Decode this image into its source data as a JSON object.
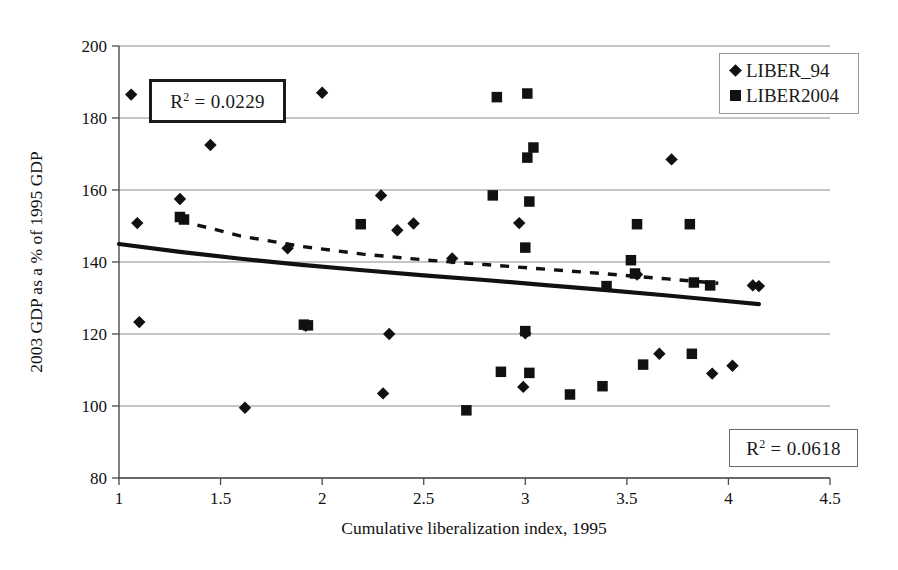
{
  "chart_data": {
    "type": "scatter",
    "title": "",
    "xlabel": "Cumulative liberalization index, 1995",
    "ylabel": "2003 GDP as a % of 1995 GDP",
    "xlim": [
      1,
      4.5
    ],
    "ylim": [
      80,
      200
    ],
    "xticks": [
      "1",
      "1.5",
      "2",
      "2.5",
      "3",
      "3.5",
      "4",
      "4.5"
    ],
    "xtick_values": [
      1,
      1.5,
      2,
      2.5,
      3,
      3.5,
      4,
      4.5
    ],
    "yticks": [
      "80",
      "100",
      "120",
      "140",
      "160",
      "180",
      "200"
    ],
    "ytick_values": [
      80,
      100,
      120,
      140,
      160,
      180,
      200
    ],
    "grid": true,
    "legend_position": "top-right",
    "series": [
      {
        "name": "LIBER_94",
        "marker": "diamond",
        "color": "#111111",
        "points": [
          [
            1.06,
            186.5
          ],
          [
            1.09,
            150.8
          ],
          [
            1.1,
            123.3
          ],
          [
            1.3,
            157.5
          ],
          [
            1.31,
            152.2
          ],
          [
            1.45,
            172.5
          ],
          [
            1.62,
            99.5
          ],
          [
            1.83,
            143.8
          ],
          [
            1.92,
            122.3
          ],
          [
            2.0,
            187.0
          ],
          [
            2.29,
            158.5
          ],
          [
            2.3,
            103.5
          ],
          [
            2.33,
            120.0
          ],
          [
            2.37,
            148.8
          ],
          [
            2.45,
            150.7
          ],
          [
            2.64,
            141.0
          ],
          [
            2.97,
            150.8
          ],
          [
            2.99,
            105.3
          ],
          [
            3.0,
            120.2
          ],
          [
            3.55,
            136.5
          ],
          [
            3.66,
            114.5
          ],
          [
            3.72,
            168.5
          ],
          [
            3.92,
            109.0
          ],
          [
            4.02,
            111.2
          ],
          [
            4.12,
            133.5
          ],
          [
            4.15,
            133.3
          ]
        ]
      },
      {
        "name": "LIBER2004",
        "marker": "square",
        "color": "#111111",
        "points": [
          [
            1.3,
            152.5
          ],
          [
            1.32,
            151.8
          ],
          [
            1.91,
            122.6
          ],
          [
            1.93,
            122.4
          ],
          [
            2.19,
            150.5
          ],
          [
            2.71,
            98.8
          ],
          [
            2.84,
            158.5
          ],
          [
            2.86,
            185.8
          ],
          [
            2.88,
            109.5
          ],
          [
            3.01,
            186.8
          ],
          [
            3.01,
            169.0
          ],
          [
            3.02,
            156.8
          ],
          [
            3.04,
            171.8
          ],
          [
            3.0,
            144.0
          ],
          [
            3.0,
            120.8
          ],
          [
            3.02,
            109.2
          ],
          [
            3.22,
            103.2
          ],
          [
            3.38,
            105.5
          ],
          [
            3.4,
            133.3
          ],
          [
            3.52,
            140.5
          ],
          [
            3.54,
            136.8
          ],
          [
            3.55,
            150.5
          ],
          [
            3.58,
            111.5
          ],
          [
            3.81,
            150.5
          ],
          [
            3.82,
            114.5
          ],
          [
            3.83,
            134.3
          ],
          [
            3.91,
            133.5
          ]
        ]
      }
    ],
    "trendlines": [
      {
        "name": "LIBER2004-trend",
        "style": "dashed",
        "r_squared": 0.0229,
        "points": [
          [
            1.3,
            151.5
          ],
          [
            1.6,
            147.2
          ],
          [
            1.9,
            144.3
          ],
          [
            2.2,
            142.2
          ],
          [
            2.5,
            140.6
          ],
          [
            2.8,
            139.3
          ],
          [
            3.1,
            138.0
          ],
          [
            3.4,
            136.7
          ],
          [
            3.7,
            135.3
          ],
          [
            3.95,
            134.1
          ]
        ]
      },
      {
        "name": "LIBER_94-trend",
        "style": "solid",
        "r_squared": 0.0618,
        "points": [
          [
            1.0,
            145.0
          ],
          [
            1.3,
            142.8
          ],
          [
            1.6,
            140.9
          ],
          [
            1.9,
            139.2
          ],
          [
            2.2,
            137.7
          ],
          [
            2.5,
            136.3
          ],
          [
            2.8,
            135.0
          ],
          [
            3.1,
            133.6
          ],
          [
            3.4,
            132.2
          ],
          [
            3.7,
            130.7
          ],
          [
            4.0,
            129.1
          ],
          [
            4.15,
            128.3
          ]
        ]
      }
    ],
    "annotations": [
      {
        "id": "r2-top",
        "text": "R² = 0.0229",
        "value": 0.0229,
        "prefix": "R",
        "superscript": "2",
        "body": " = 0.0229"
      },
      {
        "id": "r2-bottom",
        "text": "R² = 0.0618",
        "value": 0.0618,
        "prefix": "R",
        "superscript": "2",
        "body": " = 0.0618"
      }
    ]
  },
  "legend": {
    "items": [
      {
        "label": "LIBER_94",
        "marker": "diamond"
      },
      {
        "label": "LIBER2004",
        "marker": "square"
      }
    ]
  },
  "annotations": {
    "top": {
      "prefix": "R",
      "superscript": "2",
      "body": " = 0.0229"
    },
    "bottom": {
      "prefix": "R",
      "superscript": "2",
      "body": " = 0.0618"
    }
  }
}
